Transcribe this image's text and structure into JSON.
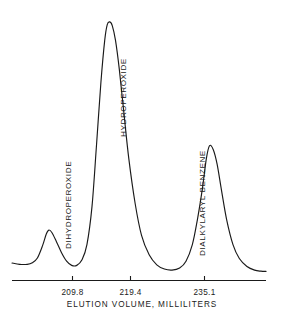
{
  "chart_data": {
    "type": "line",
    "title": "",
    "subtitle": "",
    "xlabel": "ELUTION VOLUME, MILLILITERS",
    "ylabel": "",
    "grid": false,
    "legend_position": "none",
    "xtick_labels": [
      "209.8",
      "219.4",
      "235.1"
    ],
    "xtick_values": [
      209.8,
      219.4,
      235.1
    ],
    "xlim": [
      204.0,
      244.0
    ],
    "ylim": [
      0,
      100
    ],
    "annotations": [
      {
        "text": "DIHYDROPEROXIDE",
        "x": 209.8,
        "rotation": -90
      },
      {
        "text": "HYDROPEROXIDE",
        "x": 219.4,
        "rotation": -90
      },
      {
        "text": "DIALKYLARYL BENZENE",
        "x": 235.1,
        "rotation": -90
      }
    ],
    "peaks": [
      {
        "name": "DIHYDROPEROXIDE",
        "center": 209.8,
        "height": 18,
        "width": 3.2
      },
      {
        "name": "HYDROPEROXIDE",
        "center": 219.4,
        "height": 97,
        "width": 2.6
      },
      {
        "name": "DIALKYLARYL BENZENE",
        "center": 235.1,
        "height": 50,
        "width": 2.2
      }
    ],
    "series": [
      {
        "name": "detector-response",
        "x": [
          204.0,
          205.2,
          206.4,
          207.2,
          208.0,
          208.8,
          209.4,
          209.8,
          210.3,
          211.0,
          211.8,
          212.6,
          213.4,
          214.2,
          215.0,
          215.8,
          216.6,
          217.3,
          218.0,
          218.6,
          219.0,
          219.4,
          219.8,
          220.3,
          220.9,
          221.6,
          222.4,
          223.4,
          224.4,
          225.6,
          226.8,
          228.0,
          229.2,
          230.4,
          231.4,
          232.4,
          233.2,
          234.0,
          234.6,
          235.1,
          235.7,
          236.3,
          237.0,
          237.8,
          238.8,
          239.8,
          241.0,
          242.2,
          243.2,
          244.0
        ],
        "y": [
          5.5,
          5.0,
          5.0,
          5.6,
          7.4,
          12.0,
          16.5,
          18.0,
          17.0,
          13.6,
          9.4,
          6.2,
          4.6,
          4.6,
          6.6,
          12.5,
          27.0,
          50.0,
          74.0,
          90.0,
          96.0,
          97.0,
          95.5,
          90.0,
          79.0,
          63.0,
          45.0,
          28.0,
          16.0,
          8.6,
          4.8,
          3.2,
          2.8,
          3.6,
          6.2,
          12.5,
          22.0,
          34.0,
          45.0,
          50.0,
          48.5,
          43.0,
          33.0,
          22.0,
          12.5,
          7.2,
          4.2,
          2.8,
          2.4,
          2.3
        ]
      }
    ]
  },
  "axis": {
    "title": "ELUTION VOLUME, MILLILITERS",
    "ticks": [
      {
        "label": "209.8"
      },
      {
        "label": "219.4"
      },
      {
        "label": "235.1"
      }
    ]
  },
  "peak_labels": {
    "first": "DIHYDROPEROXIDE",
    "second": "HYDROPEROXIDE",
    "third": "DIALKYLARYL BENZENE"
  },
  "colors": {
    "ink": "#1a1a1a",
    "background": "#ffffff"
  }
}
